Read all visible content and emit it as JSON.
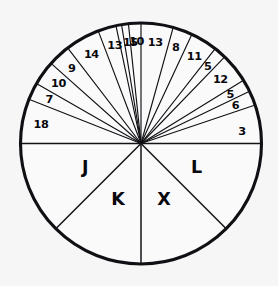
{
  "figure": {
    "name": "circle-wedge-wheel",
    "background_color": "#f7f6f7",
    "stroke_color": "#100f13",
    "fill_color": "#fbfafb",
    "center_x": 141,
    "center_y": 143.5,
    "radius": 120.5
  },
  "chart_data": {
    "type": "pie",
    "title": "",
    "subtitle": "",
    "xlabel": "",
    "ylabel": "",
    "legend": "none",
    "grid": false,
    "total_top_value": 151,
    "top_half_span_degrees": 180,
    "bottom_half_span_degrees": 180,
    "categories": [
      "18",
      "7",
      "10",
      "9",
      "14",
      "13",
      "15",
      "10",
      "13",
      "8",
      "11",
      "5",
      "12",
      "5",
      "6",
      "3",
      "L",
      "X",
      "K",
      "J"
    ],
    "values": [
      18,
      7,
      10,
      9,
      14,
      13,
      15,
      10,
      13,
      8,
      11,
      5,
      12,
      5,
      6,
      3,
      null,
      null,
      null,
      null
    ],
    "top_wedges": [
      {
        "label": "18",
        "value": 18,
        "start_deg": 180.0,
        "end_deg": 158.5,
        "mid_deg": 169.2
      },
      {
        "label": "7",
        "value": 7,
        "start_deg": 158.5,
        "end_deg": 150.2,
        "mid_deg": 154.3
      },
      {
        "label": "10",
        "value": 10,
        "start_deg": 150.2,
        "end_deg": 138.3,
        "mid_deg": 144.2
      },
      {
        "label": "9",
        "value": 9,
        "start_deg": 138.3,
        "end_deg": 127.5,
        "mid_deg": 132.9
      },
      {
        "label": "14",
        "value": 14,
        "start_deg": 127.5,
        "end_deg": 110.8,
        "mid_deg": 119.2
      },
      {
        "label": "13",
        "value": 13,
        "start_deg": 110.8,
        "end_deg": 99.3,
        "mid_deg": 105.0
      },
      {
        "label": "15",
        "value": 15,
        "start_deg": 99.3,
        "end_deg": 102.0,
        "mid_deg": 96.0
      },
      {
        "label": "10",
        "value": 10,
        "start_deg": 96.0,
        "end_deg": 90.0,
        "mid_deg": 92.5
      },
      {
        "label": "13",
        "value": 13,
        "start_deg": 90.0,
        "end_deg": 74.5,
        "mid_deg": 82.0
      },
      {
        "label": "8",
        "value": 8,
        "start_deg": 74.5,
        "end_deg": 65.0,
        "mid_deg": 70.0
      },
      {
        "label": "11",
        "value": 11,
        "start_deg": 65.0,
        "end_deg": 52.0,
        "mid_deg": 58.5
      },
      {
        "label": "5",
        "value": 5,
        "start_deg": 52.0,
        "end_deg": 46.0,
        "mid_deg": 49.0
      },
      {
        "label": "12",
        "value": 12,
        "start_deg": 46.0,
        "end_deg": 31.7,
        "mid_deg": 38.8
      },
      {
        "label": "5",
        "value": 5,
        "start_deg": 31.7,
        "end_deg": 25.7,
        "mid_deg": 28.7
      },
      {
        "label": "6",
        "value": 6,
        "start_deg": 25.7,
        "end_deg": 18.6,
        "mid_deg": 22.1
      },
      {
        "label": "3",
        "value": 3,
        "start_deg": 18.6,
        "end_deg": 0.0,
        "mid_deg": 7.0
      }
    ],
    "bottom_sectors": [
      {
        "label": "L",
        "start_deg": 0,
        "end_deg": -45,
        "mid_deg": -22.5,
        "span_deg": 45
      },
      {
        "label": "X",
        "start_deg": -45,
        "end_deg": -90,
        "mid_deg": -67.5,
        "span_deg": 45
      },
      {
        "label": "K",
        "start_deg": -90,
        "end_deg": -135,
        "mid_deg": -112.5,
        "span_deg": 45
      },
      {
        "label": "J",
        "start_deg": -135,
        "end_deg": -180,
        "mid_deg": -157.5,
        "span_deg": 45
      }
    ]
  }
}
